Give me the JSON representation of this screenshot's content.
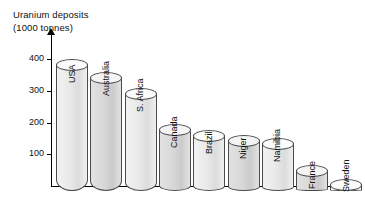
{
  "chart_data": {
    "type": "bar",
    "title": "Uranium deposits",
    "subtitle": "(1000 tonnes)",
    "xlabel": "",
    "ylabel": "Uranium deposits (1000 tonnes)",
    "ylim": [
      0,
      430
    ],
    "yticks": [
      100,
      200,
      300,
      400
    ],
    "ytick_labels": [
      "100",
      "200",
      "300",
      "400"
    ],
    "grid": false,
    "legend": null,
    "style": "3d-cylinder-bars",
    "categories": [
      "USA",
      "Australia",
      "S. Africa",
      "Canada",
      "Brazil",
      "Niger",
      "Namibia",
      "France",
      "Sweden"
    ],
    "values": [
      400,
      360,
      310,
      195,
      175,
      160,
      152,
      65,
      20
    ],
    "units": "1000 tonnes"
  },
  "axis": {
    "y_ticks": [
      {
        "label": "400",
        "value": 400
      },
      {
        "label": "300",
        "value": 300
      },
      {
        "label": "200",
        "value": 200
      },
      {
        "label": "100",
        "value": 100
      }
    ]
  },
  "bars": [
    {
      "label": "USA",
      "value": 400,
      "shade": "light"
    },
    {
      "label": "Australia",
      "value": 360,
      "shade": "dark"
    },
    {
      "label": "S. Africa",
      "value": 310,
      "shade": "light"
    },
    {
      "label": "Canada",
      "value": 195,
      "shade": "dark"
    },
    {
      "label": "Brazil",
      "value": 175,
      "shade": "light"
    },
    {
      "label": "Niger",
      "value": 160,
      "shade": "dark"
    },
    {
      "label": "Namibia",
      "value": 152,
      "shade": "light"
    },
    {
      "label": "France",
      "value": 65,
      "shade": "dark"
    },
    {
      "label": "Sweden",
      "value": 20,
      "shade": "light"
    }
  ],
  "colors": {
    "axis": "#000000",
    "bar_outline": "#4a4a4a",
    "bar_light": "#eaeaea",
    "bar_dark": "#d8d8d8",
    "text": "#111111",
    "background": "#ffffff"
  }
}
